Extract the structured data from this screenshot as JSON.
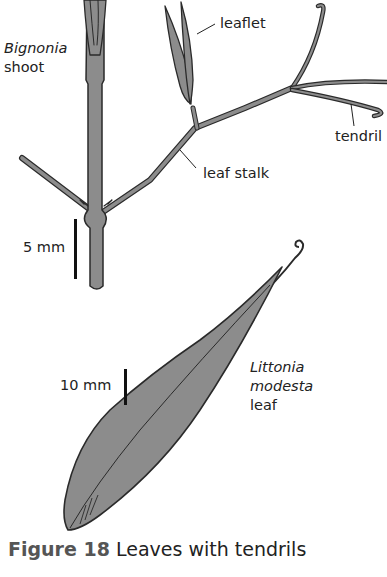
{
  "figure": {
    "caption_label": "Figure 18",
    "caption_text": "Leaves with tendrils"
  },
  "bignonia": {
    "name_line1": "Bignonia",
    "name_line2": "shoot",
    "labels": {
      "leaflet": "leaflet",
      "tendril": "tendril",
      "leaf_stalk": "leaf stalk"
    },
    "scale_bar": "5 mm"
  },
  "littonia": {
    "name_line1": "Littonia",
    "name_line2": "modesta",
    "name_line3": "leaf",
    "scale_bar": "10 mm"
  },
  "colors": {
    "fill": "#8c8c8c",
    "outline": "#2a2a2a",
    "text": "#222222"
  }
}
